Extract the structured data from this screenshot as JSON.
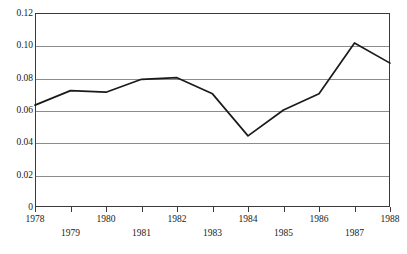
{
  "chart_data": {
    "type": "line",
    "title": "",
    "xlabel": "",
    "ylabel": "",
    "categories": [
      1978,
      1979,
      1980,
      1981,
      1982,
      1983,
      1984,
      1985,
      1986,
      1987,
      1988
    ],
    "x_tick_labels": [
      "1978",
      "1979",
      "1980",
      "1981",
      "1982",
      "1983",
      "1984",
      "1985",
      "1986",
      "1987",
      "1988"
    ],
    "values": [
      0.063,
      0.072,
      0.071,
      0.079,
      0.08,
      0.07,
      0.044,
      0.06,
      0.07,
      0.1015,
      0.089
    ],
    "series": [
      {
        "name": "",
        "values": [
          0.063,
          0.072,
          0.071,
          0.079,
          0.08,
          0.07,
          0.044,
          0.06,
          0.07,
          0.1015,
          0.089
        ]
      }
    ],
    "xlim": [
      1978,
      1988
    ],
    "ylim": [
      0,
      0.12
    ],
    "y_tick_values": [
      0,
      0.02,
      0.04,
      0.06,
      0.08,
      0.1,
      0.12
    ],
    "y_tick_labels": [
      "0",
      "0.02",
      "0.04",
      "0.06",
      "0.08",
      "0.10",
      "0.12"
    ],
    "grid": true,
    "grid_axis": "y",
    "legend": false,
    "legend_position": "none",
    "line_color": "#1a1a1a",
    "grid_color": "#8c8c8c",
    "frame_color": "#3a3a3a",
    "background_color": "#ffffff",
    "x_label_layout": "staggered-two-rows",
    "annotations": []
  }
}
